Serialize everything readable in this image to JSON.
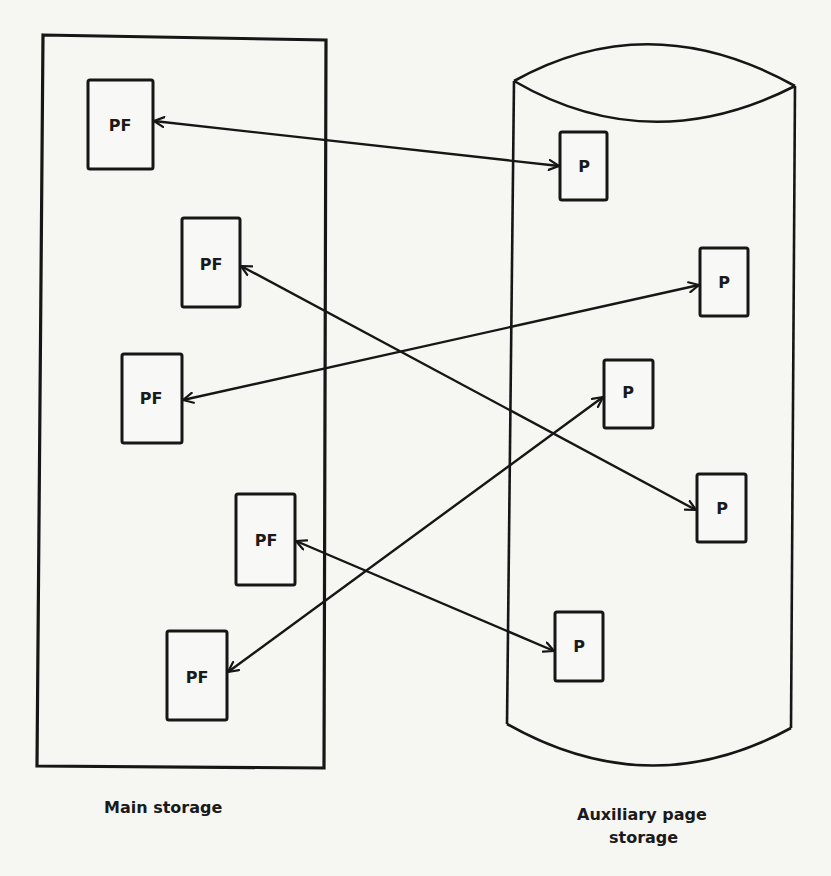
{
  "diagram": {
    "main_storage": {
      "label": "Main storage",
      "frames": [
        {
          "id": "pf1",
          "label": "PF"
        },
        {
          "id": "pf2",
          "label": "PF"
        },
        {
          "id": "pf3",
          "label": "PF"
        },
        {
          "id": "pf4",
          "label": "PF"
        },
        {
          "id": "pf5",
          "label": "PF"
        }
      ]
    },
    "auxiliary_storage": {
      "label_line1": "Auxiliary page",
      "label_line2": "storage",
      "pages": [
        {
          "id": "p1",
          "label": "P"
        },
        {
          "id": "p2",
          "label": "P"
        },
        {
          "id": "p3",
          "label": "P"
        },
        {
          "id": "p4",
          "label": "P"
        },
        {
          "id": "p5",
          "label": "P"
        }
      ]
    },
    "connections": [
      {
        "from": "pf1",
        "to": "p1",
        "direction": "bidirectional"
      },
      {
        "from": "pf2",
        "to": "p4",
        "direction": "bidirectional"
      },
      {
        "from": "pf3",
        "to": "p2",
        "direction": "bidirectional"
      },
      {
        "from": "pf4",
        "to": "p5",
        "direction": "bidirectional"
      },
      {
        "from": "pf5",
        "to": "p3",
        "direction": "bidirectional"
      }
    ],
    "colors": {
      "line": "#161616",
      "background": "#f6f6f3"
    }
  }
}
